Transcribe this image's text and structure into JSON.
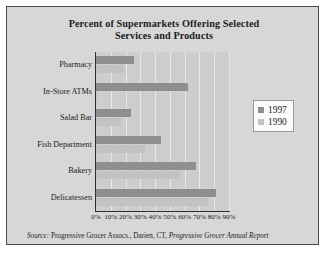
{
  "chart_data": {
    "type": "bar",
    "orientation": "horizontal",
    "title": "Percent of Supermarkets Offering Selected Services and Products",
    "title_line1": "Percent of Supermarkets Offering Selected",
    "title_line2": "Services and Products",
    "xlabel": "",
    "ylabel": "",
    "categories": [
      "Pharmacy",
      "In-Store ATMs",
      "Salad Bar",
      "Fish Department",
      "Bakery",
      "Delicatessen"
    ],
    "series": [
      {
        "name": "1997",
        "color": "#8f8f8f",
        "values": [
          26,
          62,
          24,
          44,
          68,
          81
        ]
      },
      {
        "name": "1990",
        "color": "#c2c2c2",
        "values": [
          19,
          1,
          17,
          33,
          57,
          76
        ]
      }
    ],
    "xlim": [
      0,
      90
    ],
    "xticks": [
      0,
      10,
      20,
      30,
      40,
      50,
      60,
      70,
      80,
      90
    ],
    "xtick_labels": [
      "0%",
      "10%",
      "20%",
      "30%",
      "40%",
      "50%",
      "60%",
      "70%",
      "80%",
      "90%"
    ],
    "grid": true,
    "grid_axis": "x",
    "legend_position": "right"
  },
  "legend": {
    "entries": [
      {
        "label": "1997",
        "color": "#8f8f8f"
      },
      {
        "label": "1990",
        "color": "#c2c2c2"
      }
    ]
  },
  "source": {
    "prefix": "Source:",
    "body": " Progressive Grocer Assocs., Darien, CT, ",
    "publication": "Progressive Grocer Annual Report"
  }
}
